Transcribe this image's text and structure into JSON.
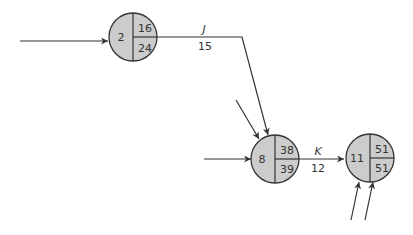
{
  "colors": {
    "node_fill": "#cccccc",
    "stroke": "#333333",
    "background": "#ffffff"
  },
  "nodes": [
    {
      "id": "2",
      "label": "2",
      "early": "16",
      "late": "24",
      "cx": 133,
      "cy": 37,
      "r": 24
    },
    {
      "id": "8",
      "label": "8",
      "early": "38",
      "late": "39",
      "cx": 275,
      "cy": 159,
      "r": 24
    },
    {
      "id": "11",
      "label": "11",
      "early": "51",
      "late": "51",
      "cx": 368,
      "cy": 159,
      "r": 24
    }
  ],
  "activities": [
    {
      "name": "J",
      "duration": "15",
      "from": "2",
      "to": "8"
    },
    {
      "name": "K",
      "duration": "12",
      "from": "8",
      "to": "11"
    }
  ]
}
